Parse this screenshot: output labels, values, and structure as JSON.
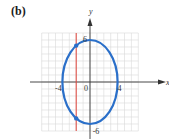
{
  "panel_label": "(b)",
  "chart_data": {
    "type": "line",
    "title": "",
    "xlabel": "x",
    "ylabel": "y",
    "xlim": [
      -7,
      7
    ],
    "ylim": [
      -7,
      7
    ],
    "grid": true,
    "grid_step": 1,
    "x_ticks": [
      {
        "value": -4,
        "label": "-4"
      },
      {
        "value": 0,
        "label": "0"
      },
      {
        "value": 4,
        "label": "4"
      }
    ],
    "y_ticks": [
      {
        "value": 6,
        "label": "6"
      },
      {
        "value": -6,
        "label": "-6"
      }
    ],
    "series": [
      {
        "name": "ellipse",
        "kind": "ellipse",
        "center": [
          0,
          0
        ],
        "semi_x": 4,
        "semi_y": 6,
        "equation": "x^2/16 + y^2/36 = 1",
        "color": "#2a6fc9"
      },
      {
        "name": "vertical-line",
        "kind": "vline",
        "x": -2,
        "color": "#e0443c"
      }
    ],
    "points": [
      {
        "x": -2,
        "y": 5.2,
        "color": "#2a6fc9"
      },
      {
        "x": -2,
        "y": -5.2,
        "color": "#2a6fc9"
      }
    ],
    "colors": {
      "grid": "#d8d8d8",
      "axis": "#333333"
    }
  }
}
